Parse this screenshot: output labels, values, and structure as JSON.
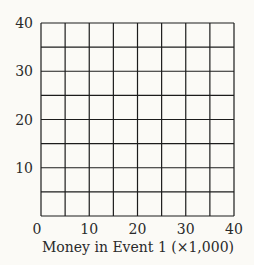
{
  "chart_data": {
    "type": "scatter",
    "title": "",
    "xlabel": "Money in Event 1 (×1,000)",
    "ylabel": "",
    "xlim": [
      0,
      40
    ],
    "ylim": [
      0,
      40
    ],
    "x_ticks": [
      "0",
      "10",
      "20",
      "30",
      "40"
    ],
    "y_ticks": [
      "10",
      "20",
      "30",
      "40"
    ],
    "grid": true,
    "grid_step": 5,
    "series": [],
    "legend": null
  }
}
